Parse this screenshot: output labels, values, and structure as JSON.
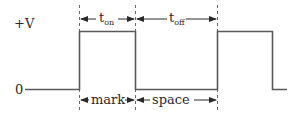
{
  "diagram": {
    "type": "square-wave timing diagram",
    "colors": {
      "waveform": "#5a5a5a",
      "dashed": "#6a6a6a",
      "arrow": "#2a2a2a",
      "text": "#2a2a2a",
      "background": "#ffffff"
    },
    "axis_labels": {
      "high": "+V",
      "low": "0"
    },
    "top_annotations": [
      {
        "base": "t",
        "subscript": "on",
        "span": "first pulse high duration"
      },
      {
        "base": "t",
        "subscript": "off",
        "span": "low duration between pulses"
      }
    ],
    "bottom_annotations": [
      {
        "label": "mark",
        "span": "first pulse high duration"
      },
      {
        "label": "space",
        "span": "low duration between pulses"
      }
    ],
    "waveform": {
      "levels": [
        "0",
        "+V"
      ],
      "sequence": [
        "low",
        "high",
        "low",
        "high",
        "low"
      ]
    }
  }
}
